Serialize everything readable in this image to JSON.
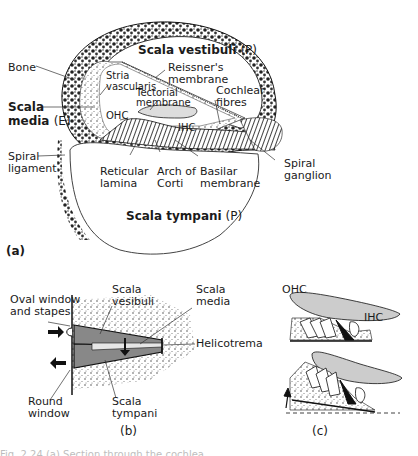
{
  "figure": {
    "panel_a": {
      "tag": "(a)",
      "labels": {
        "scala_vestibuli": "Scala vestibuli",
        "scala_vestibuli_suffix": " (P)",
        "reissners_membrane": "Reissner's\nmembrane",
        "bone": "Bone",
        "stria_vascularis": "Stria\nvascularis",
        "tectorial_membrane": "Tectorial\nmembrane",
        "cochlear_fibres": "Cochlear\nfibres",
        "scala_media": "Scala\nmedia",
        "scala_media_suffix": "(E)",
        "ohc": "OHC",
        "ihc": "IHC",
        "spiral_ligament": "Spiral\nligament",
        "reticular_lamina": "Reticular\nlamina",
        "arch_of_corti": "Arch of\nCorti",
        "basilar_membrane": "Basilar\nmembrane",
        "spiral_ganglion": "Spiral\nganglion",
        "scala_tympani": "Scala tympani",
        "scala_tympani_suffix": " (P)"
      }
    },
    "panel_b": {
      "tag": "(b)",
      "labels": {
        "oval_window": "Oval window\nand stapes",
        "scala_vestibuli": "Scala\nvesibuli",
        "scala_media": "Scala\nmedia",
        "helicotrema": "Helicotrema",
        "round_window": "Round\nwindow",
        "scala_tympani": "Scala\ntympani"
      }
    },
    "panel_c": {
      "tag": "(c)",
      "labels": {
        "ohc": "OHC",
        "ihc": "IHC"
      }
    },
    "caption": "Fig. 2.24 (a) Section through the cochlea"
  }
}
